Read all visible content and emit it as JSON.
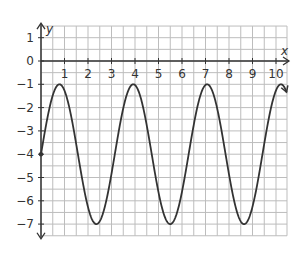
{
  "chart_data": {
    "type": "line",
    "title": "",
    "xlabel": "x",
    "ylabel": "y",
    "function": "y = 3 sin(2x) - 4",
    "xlim": [
      0,
      10.5
    ],
    "ylim": [
      -7.5,
      1.5
    ],
    "x_ticks": [
      1,
      2,
      3,
      4,
      5,
      6,
      7,
      8,
      9,
      10
    ],
    "y_ticks": [
      1,
      0,
      -1,
      -2,
      -3,
      -4,
      -5,
      -6,
      -7
    ],
    "grid": true,
    "grid_step": 0.5,
    "maxima": [
      [
        0.785,
        -1
      ],
      [
        3.93,
        -1
      ],
      [
        7.07,
        -1
      ],
      [
        10.21,
        -1
      ]
    ],
    "minima": [
      [
        2.36,
        -7
      ],
      [
        5.5,
        -7
      ],
      [
        8.64,
        -7
      ]
    ],
    "start_point": [
      0,
      -4
    ],
    "series": [
      {
        "name": "y = 3 sin(2x) - 4",
        "color": "#333333"
      }
    ]
  },
  "colors": {
    "grid": "#bdbdbd",
    "axis": "#333333",
    "curve": "#333333"
  }
}
